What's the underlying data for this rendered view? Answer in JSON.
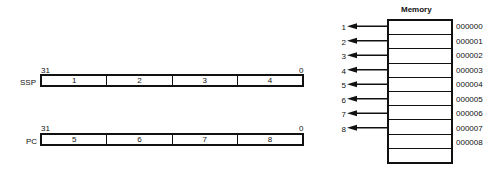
{
  "registers": [
    {
      "name": "SSP",
      "high_bit": "31",
      "low_bit": "0",
      "bytes": [
        "1",
        "2",
        "3",
        "4"
      ]
    },
    {
      "name": "PC",
      "high_bit": "31",
      "low_bit": "0",
      "bytes": [
        "5",
        "6",
        "7",
        "8"
      ]
    }
  ],
  "memory": {
    "title": "Memory",
    "addresses": [
      "000000",
      "000001",
      "000002",
      "000003",
      "000004",
      "000005",
      "000006",
      "000007",
      "000008"
    ],
    "pointers": [
      "1",
      "2",
      "3",
      "4",
      "5",
      "6",
      "7",
      "8"
    ],
    "row_count": 10
  }
}
